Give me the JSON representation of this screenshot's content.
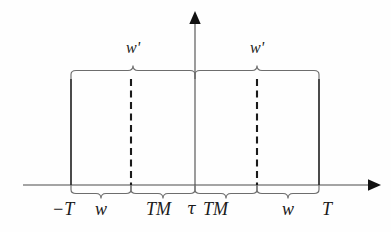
{
  "figure": {
    "background_color": "#fefefe",
    "stroke_color": "#3a3a3a",
    "dash_color": "#1a1a1a",
    "axis_color": "#4a4a4a"
  },
  "axes": {
    "horizontal": {
      "name": "time-axis",
      "y": 185,
      "x_start": 23,
      "x_end": 378,
      "arrow": "right-arrowhead"
    },
    "vertical": {
      "name": "value-axis",
      "x": 195,
      "y_start": 185,
      "y_end": 14,
      "arrow": "up-arrowhead"
    }
  },
  "boundaries": {
    "left_edge_x": 71,
    "left_dash_x": 131,
    "center_x": 195,
    "right_dash_x": 257,
    "right_edge_x": 319,
    "top_y": 72,
    "bottom_y": 185
  },
  "top_braces": [
    {
      "name": "brace-top-left",
      "x_from": 71,
      "x_to": 195,
      "label": "w'",
      "label_x": 133,
      "label_y": 40
    },
    {
      "name": "brace-top-right",
      "x_from": 195,
      "x_to": 319,
      "label": "w'",
      "label_x": 257,
      "label_y": 40
    }
  ],
  "bottom_braces": [
    {
      "name": "brace-bottom-w-left",
      "x_from": 71,
      "x_to": 131,
      "label": "w",
      "label_x": 101,
      "label_y": 210
    },
    {
      "name": "brace-bottom-tm-left",
      "x_from": 131,
      "x_to": 195,
      "label": "TM",
      "label_x": 163,
      "label_y": 210
    },
    {
      "name": "brace-bottom-tm-right",
      "x_from": 195,
      "x_to": 257,
      "label": "TM",
      "label_x": 226,
      "label_y": 210
    },
    {
      "name": "brace-bottom-w-right",
      "x_from": 257,
      "x_to": 319,
      "label": "w",
      "label_x": 288,
      "label_y": 210
    }
  ],
  "endpoint_labels": [
    {
      "name": "label-minus-T",
      "text": "−T",
      "x": 52,
      "y": 208
    },
    {
      "name": "label-tau",
      "text": "τ",
      "x": 188,
      "y": 209
    },
    {
      "name": "label-T",
      "text": "T",
      "x": 323,
      "y": 208
    }
  ],
  "dashed_lines": [
    {
      "name": "dashed-line-left",
      "x": 131,
      "y_top": 78,
      "y_bottom": 185
    },
    {
      "name": "dashed-line-right",
      "x": 257,
      "y_top": 78,
      "y_bottom": 185
    }
  ],
  "solid_edges": [
    {
      "name": "solid-edge-left",
      "x": 71,
      "y_top": 78,
      "y_bottom": 185
    },
    {
      "name": "solid-edge-right",
      "x": 319,
      "y_top": 78,
      "y_bottom": 185
    }
  ]
}
